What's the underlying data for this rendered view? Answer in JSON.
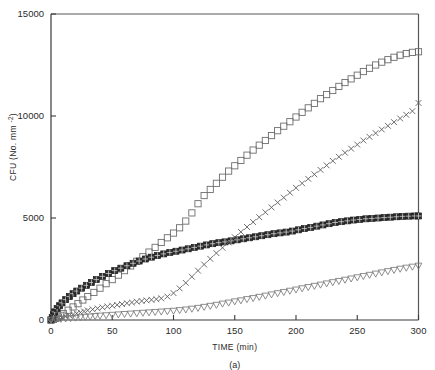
{
  "figure": {
    "caption": "(a)"
  },
  "chart_data": {
    "type": "scatter",
    "title": "",
    "xlabel": "TIME (min)",
    "ylabel": "CFU (No. mm⁻²)",
    "xlim": [
      0,
      300
    ],
    "ylim": [
      0,
      15000
    ],
    "xticks": [
      0,
      50,
      100,
      150,
      200,
      250,
      300
    ],
    "yticks": [
      0,
      5000,
      10000,
      15000
    ],
    "xtick_labels": [
      "0",
      "50",
      "100",
      "150",
      "200",
      "250",
      "300"
    ],
    "ytick_labels": [
      "0",
      "5000",
      "10000",
      "15000"
    ],
    "grid": false,
    "legend": "none",
    "series": [
      {
        "name": "open-square",
        "marker": "open square",
        "color": "#6d6d6d",
        "x": [
          0,
          2,
          4,
          6,
          8,
          10,
          14,
          18,
          22,
          26,
          30,
          35,
          40,
          45,
          50,
          55,
          60,
          65,
          70,
          75,
          80,
          85,
          90,
          95,
          100,
          105,
          110,
          115,
          120,
          125,
          130,
          135,
          140,
          145,
          150,
          155,
          160,
          165,
          170,
          175,
          180,
          185,
          190,
          195,
          200,
          205,
          210,
          215,
          220,
          225,
          230,
          235,
          240,
          245,
          250,
          255,
          260,
          265,
          270,
          275,
          280,
          285,
          290,
          295,
          300
        ],
        "y": [
          0,
          30,
          80,
          150,
          230,
          320,
          480,
          640,
          800,
          980,
          1150,
          1350,
          1560,
          1780,
          1980,
          2200,
          2420,
          2650,
          2880,
          3100,
          3330,
          3560,
          3800,
          4030,
          4260,
          4520,
          4850,
          5250,
          5700,
          6100,
          6400,
          6700,
          7000,
          7300,
          7560,
          7820,
          8080,
          8330,
          8570,
          8800,
          9040,
          9280,
          9500,
          9720,
          9950,
          10180,
          10400,
          10620,
          10850,
          11050,
          11250,
          11450,
          11640,
          11820,
          12000,
          12180,
          12340,
          12500,
          12640,
          12760,
          12880,
          12980,
          13060,
          13120,
          13150
        ]
      },
      {
        "name": "filled-square",
        "marker": "filled square",
        "color": "#2e2e2e",
        "x": [
          0,
          1,
          2,
          3,
          5,
          7,
          9,
          12,
          15,
          18,
          21,
          25,
          29,
          33,
          37,
          42,
          47,
          52,
          57,
          62,
          67,
          72,
          77,
          82,
          87,
          92,
          97,
          102,
          107,
          112,
          117,
          122,
          127,
          132,
          137,
          142,
          147,
          152,
          157,
          162,
          167,
          172,
          177,
          182,
          187,
          192,
          197,
          202,
          207,
          212,
          217,
          222,
          227,
          232,
          237,
          242,
          247,
          252,
          257,
          262,
          267,
          272,
          277,
          282,
          287,
          292,
          297,
          300
        ],
        "y": [
          0,
          120,
          260,
          400,
          560,
          700,
          840,
          1000,
          1150,
          1290,
          1420,
          1560,
          1700,
          1840,
          1980,
          2140,
          2280,
          2420,
          2540,
          2660,
          2780,
          2890,
          2990,
          3080,
          3160,
          3240,
          3310,
          3370,
          3430,
          3490,
          3560,
          3620,
          3680,
          3740,
          3790,
          3830,
          3880,
          3930,
          3980,
          4030,
          4080,
          4130,
          4180,
          4230,
          4270,
          4310,
          4360,
          4420,
          4480,
          4540,
          4600,
          4660,
          4720,
          4780,
          4820,
          4860,
          4900,
          4930,
          4960,
          4980,
          5000,
          5020,
          5040,
          5060,
          5080,
          5090,
          5100,
          5100
        ]
      },
      {
        "name": "cross",
        "marker": "x cross",
        "color": "#5c5c5c",
        "x": [
          0,
          3,
          6,
          9,
          12,
          15,
          18,
          21,
          24,
          27,
          30,
          34,
          38,
          42,
          46,
          50,
          54,
          58,
          62,
          66,
          70,
          74,
          78,
          82,
          86,
          90,
          95,
          100,
          105,
          110,
          115,
          120,
          125,
          130,
          135,
          140,
          145,
          150,
          155,
          160,
          165,
          170,
          175,
          180,
          185,
          190,
          195,
          200,
          205,
          210,
          215,
          220,
          225,
          230,
          235,
          240,
          245,
          250,
          255,
          260,
          265,
          270,
          275,
          280,
          285,
          290,
          295,
          300
        ],
        "y": [
          0,
          40,
          80,
          120,
          170,
          220,
          270,
          320,
          370,
          420,
          470,
          520,
          570,
          620,
          660,
          700,
          740,
          780,
          820,
          860,
          900,
          930,
          960,
          990,
          1020,
          1060,
          1150,
          1320,
          1550,
          1820,
          2120,
          2420,
          2720,
          3000,
          3280,
          3540,
          3800,
          4060,
          4320,
          4560,
          4800,
          5040,
          5280,
          5520,
          5760,
          6000,
          6240,
          6480,
          6700,
          6920,
          7140,
          7360,
          7580,
          7800,
          8000,
          8200,
          8400,
          8600,
          8800,
          8980,
          9160,
          9340,
          9520,
          9700,
          9880,
          10060,
          10240,
          10640
        ]
      },
      {
        "name": "open-triangle-down",
        "marker": "open triangle down",
        "color": "#7a7a7a",
        "x": [
          0,
          4,
          8,
          12,
          16,
          20,
          24,
          28,
          32,
          36,
          40,
          45,
          50,
          55,
          60,
          65,
          70,
          75,
          80,
          85,
          90,
          95,
          100,
          105,
          110,
          115,
          120,
          125,
          130,
          135,
          140,
          145,
          150,
          155,
          160,
          165,
          170,
          175,
          180,
          185,
          190,
          195,
          200,
          205,
          210,
          215,
          220,
          225,
          230,
          235,
          240,
          245,
          250,
          255,
          260,
          265,
          270,
          275,
          280,
          285,
          290,
          295,
          300
        ],
        "y": [
          0,
          20,
          40,
          60,
          80,
          100,
          120,
          140,
          160,
          180,
          200,
          220,
          240,
          260,
          280,
          300,
          320,
          340,
          360,
          380,
          400,
          420,
          440,
          470,
          500,
          540,
          580,
          630,
          680,
          730,
          790,
          840,
          900,
          950,
          1010,
          1060,
          1120,
          1180,
          1240,
          1300,
          1360,
          1420,
          1480,
          1540,
          1600,
          1660,
          1720,
          1780,
          1840,
          1900,
          1960,
          2020,
          2080,
          2140,
          2200,
          2260,
          2320,
          2380,
          2440,
          2500,
          2550,
          2600,
          2650
        ]
      }
    ]
  }
}
